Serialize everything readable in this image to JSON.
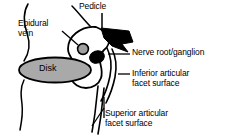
{
  "figure": {
    "background_color": "#ffffff",
    "line_color": "#000000"
  },
  "labels": {
    "pedicle": "Pedicle",
    "epidural_vein": "Epidural\nvein",
    "nerve_root": "Nerve root/ganglion",
    "inferior_facet": "Inferior articular\nfacet surface",
    "superior_facet": "Superior articular\nfacet surface",
    "disk": "Disk"
  },
  "structures": {
    "disk": {
      "name": "Disk",
      "fill_color": "#a9a9a9",
      "stroke_color": "#000000",
      "shape": "ellipse"
    },
    "epidural_vein": {
      "name": "Epidural vein",
      "fill_color": "#a0a0a0",
      "stroke_color": "#000000",
      "shape": "circle"
    },
    "nerve_root_ganglion": {
      "name": "Nerve root/ganglion",
      "fill_color": "#000000",
      "stroke_color": "#000000",
      "shape": "oval"
    },
    "pedicle": {
      "name": "Pedicle",
      "fill_color": "#000000",
      "stroke_color": "#000000",
      "shape": "wedge"
    },
    "vertebral_body": {
      "name": "Vertebral body",
      "fill_color": "#ffffff",
      "stroke_color": "#000000"
    }
  }
}
